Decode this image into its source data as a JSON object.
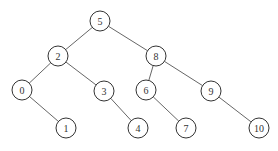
{
  "diagram": {
    "type": "binary-search-tree",
    "nodes": [
      {
        "id": "n5",
        "label": "5",
        "x": 100,
        "y": 21
      },
      {
        "id": "n2",
        "label": "2",
        "x": 58,
        "y": 56
      },
      {
        "id": "n8",
        "label": "8",
        "x": 156,
        "y": 56
      },
      {
        "id": "n0",
        "label": "0",
        "x": 22,
        "y": 90
      },
      {
        "id": "n3",
        "label": "3",
        "x": 104,
        "y": 91
      },
      {
        "id": "n6",
        "label": "6",
        "x": 146,
        "y": 90
      },
      {
        "id": "n9",
        "label": "9",
        "x": 211,
        "y": 91
      },
      {
        "id": "n1",
        "label": "1",
        "x": 66,
        "y": 128
      },
      {
        "id": "n4",
        "label": "4",
        "x": 138,
        "y": 128
      },
      {
        "id": "n7",
        "label": "7",
        "x": 186,
        "y": 128
      },
      {
        "id": "n10",
        "label": "10",
        "x": 259,
        "y": 128
      }
    ],
    "edges": [
      {
        "from": "n5",
        "to": "n2"
      },
      {
        "from": "n5",
        "to": "n8"
      },
      {
        "from": "n2",
        "to": "n0"
      },
      {
        "from": "n2",
        "to": "n3"
      },
      {
        "from": "n8",
        "to": "n6"
      },
      {
        "from": "n8",
        "to": "n9"
      },
      {
        "from": "n0",
        "to": "n1"
      },
      {
        "from": "n3",
        "to": "n4"
      },
      {
        "from": "n6",
        "to": "n7"
      },
      {
        "from": "n9",
        "to": "n10"
      }
    ],
    "node_radius": 10
  }
}
